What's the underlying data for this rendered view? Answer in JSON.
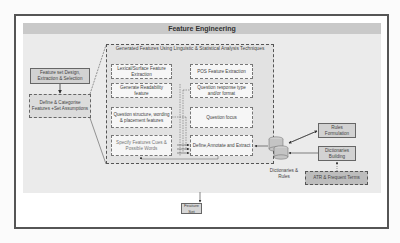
{
  "diagram": {
    "title": "Feature Engineering",
    "left_column": {
      "design_box": "Feature set Design, Extraction & Selection",
      "define_box": "Define & Categorise Features +Set Assumptions"
    },
    "group": {
      "title": "Generated Features Using Linguistic & Statistical Analysis Techniques",
      "boxes": [
        "Lexical/Surface Feature Extraction",
        "POS Feature Extraction",
        "Generate Readability feature",
        "Question response type and/or format",
        "Question structure, wording & placement features",
        "Question focus",
        "Specify Features Cues & Possible Words",
        "Define,Annotate and Extract"
      ]
    },
    "right_side": {
      "database_label": "Dictionaries & Rules",
      "rules_box": "Rules Formulation",
      "dictionaries_box": "Dictionaries Building",
      "atr_box": "ATR & Frequent Terms"
    },
    "output": {
      "feature_set": "Feature Set"
    }
  }
}
